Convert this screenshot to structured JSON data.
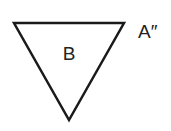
{
  "diagram": {
    "shapes": [
      {
        "type": "triangle",
        "orientation": "inverted",
        "label": "B",
        "stroke_color": "#1a1a1a",
        "fill_color": "#ffffff",
        "points": "14,23 124,23 69,120"
      }
    ],
    "labels": {
      "shape_label": "B",
      "vertex_label": "A″"
    }
  }
}
